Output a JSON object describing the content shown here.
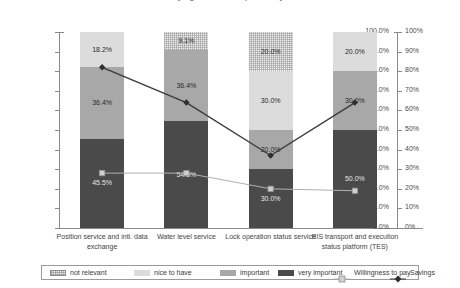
{
  "chart_data": {
    "type": "bar",
    "subtype": "stacked-bar-with-lines",
    "title": "[Logistics service providers]",
    "title_lines": [
      "[Logistics service providers]"
    ],
    "xlabel": "",
    "ylabel": "",
    "ylim": [
      0,
      100
    ],
    "y2lim": [
      0,
      100
    ],
    "grid": false,
    "legend_position": "bottom",
    "categories": [
      "Position service and intl. data exchange",
      "Water level service",
      "Lock operation status service",
      "RIS transport and execution status platform (TES)"
    ],
    "series": [
      {
        "name": "not relevant",
        "values": [
          0.0,
          9.1,
          20.0,
          0.0
        ],
        "labels": [
          "",
          "9.1%",
          "20.0%",
          ""
        ],
        "color": "#efefef",
        "pattern": "checker"
      },
      {
        "name": "nice to have",
        "values": [
          18.2,
          0.0,
          30.0,
          20.0
        ],
        "labels": [
          "18.2%",
          "",
          "30.0%",
          "20.0%"
        ],
        "color": "#dcdcdc"
      },
      {
        "name": "important",
        "values": [
          36.4,
          36.4,
          20.0,
          30.0
        ],
        "labels": [
          "36.4%",
          "36.4%",
          "20.0%",
          "30.0%"
        ],
        "color": "#a8a8a8"
      },
      {
        "name": "very important",
        "values": [
          45.5,
          54.5,
          30.0,
          50.0
        ],
        "labels": [
          "45.5%",
          "54.5%",
          "30.0%",
          "50.0%"
        ],
        "color": "#4a4a4a"
      },
      {
        "name": "Willingness to pay",
        "type": "line",
        "marker": "square",
        "values": [
          28.0,
          28.0,
          20.0,
          19.0
        ],
        "color": "#b0b0b0"
      },
      {
        "name": "Savings",
        "type": "line",
        "marker": "diamond",
        "values": [
          82.0,
          64.0,
          37.0,
          64.0
        ],
        "color": "#3a3a3a"
      }
    ],
    "y_ticks_left": [
      "0.0%",
      "10.0%",
      "20.0%",
      "30.0%",
      "40.0%",
      "50.0%",
      "60.0%",
      "70.0%",
      "80.0%",
      "90.0%",
      "100.0%"
    ],
    "y_ticks_right": [
      "0%",
      "10%",
      "20%",
      "30%",
      "40%",
      "50%",
      "60%",
      "70%",
      "80%",
      "90%",
      "100%"
    ],
    "legend": [
      {
        "label": "not relevant",
        "kind": "swatch",
        "style": "notrelevant"
      },
      {
        "label": "nice to have",
        "kind": "swatch",
        "style": "nicetohave"
      },
      {
        "label": "important",
        "kind": "swatch",
        "style": "important"
      },
      {
        "label": "very important",
        "kind": "swatch",
        "style": "veryimportant"
      },
      {
        "label": "Willingness to pay",
        "kind": "marker",
        "style": "square"
      },
      {
        "label": "Savings",
        "kind": "marker",
        "style": "diamond"
      }
    ]
  }
}
